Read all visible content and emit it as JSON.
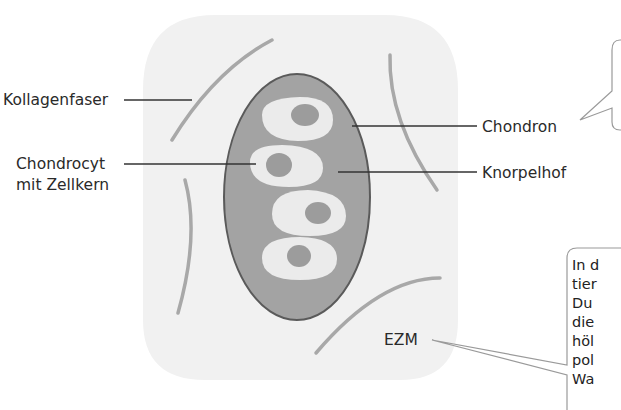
{
  "diagram": {
    "colors": {
      "matrix_fill": "#f1f1f1",
      "territory_fill": "#a3a3a3",
      "territory_stroke": "#5a5a5a",
      "cell_fill": "#ebebeb",
      "nucleus_fill": "#9c9c9c",
      "fiber": "#a8a8a8",
      "leader": "#333333",
      "callout_border": "#9a9a9a"
    },
    "labels": {
      "kollagenfaser": "Kollagenfaser",
      "chondrocyt_line1": "Chondrocyt",
      "chondrocyt_line2": "mit Zellkern",
      "chondron": "Chondron",
      "knorpelhof": "Knorpelhof",
      "ezm": "EZM"
    },
    "callouts": [
      {
        "id": "chondron-callout",
        "lines": []
      },
      {
        "id": "ezm-callout",
        "lines": [
          "In d",
          "tier",
          "Du",
          "die",
          "höl",
          "pol",
          "Wa"
        ]
      }
    ]
  }
}
